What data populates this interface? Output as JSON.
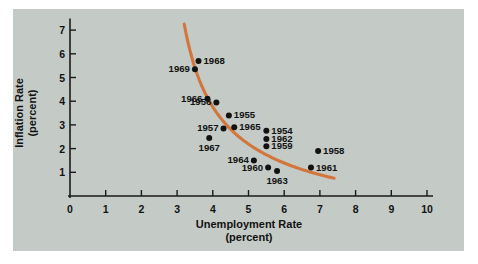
{
  "chart_data": {
    "type": "scatter",
    "title": "",
    "subtitle": "",
    "xlabel": "Unemployment Rate",
    "xlabel_unit": "(percent)",
    "ylabel": "Inflation Rate",
    "ylabel_unit": "(percent)",
    "xlim": [
      0,
      10
    ],
    "ylim": [
      0,
      7.4
    ],
    "xticks": [
      "0",
      "1",
      "2",
      "3",
      "4",
      "5",
      "6",
      "7",
      "8",
      "9",
      "10"
    ],
    "yticks": [
      "1",
      "2",
      "3",
      "4",
      "5",
      "6",
      "7"
    ],
    "grid": false,
    "legend": "none",
    "point_color": "#121212",
    "curve_color": "#d2763c",
    "panel_color": "#c4cac6",
    "axis_color": "#1b1b1b",
    "points": [
      {
        "label": "1968",
        "x": 3.6,
        "y": 5.7,
        "label_side": "right"
      },
      {
        "label": "1969",
        "x": 3.5,
        "y": 5.35,
        "label_side": "left"
      },
      {
        "label": "1966",
        "x": 3.85,
        "y": 4.1,
        "label_side": "left"
      },
      {
        "label": "1956",
        "x": 4.1,
        "y": 3.95,
        "label_side": "left"
      },
      {
        "label": "1955",
        "x": 4.45,
        "y": 3.4,
        "label_side": "right"
      },
      {
        "label": "1965",
        "x": 4.6,
        "y": 2.9,
        "label_side": "right"
      },
      {
        "label": "1957",
        "x": 4.3,
        "y": 2.85,
        "label_side": "left"
      },
      {
        "label": "1967",
        "x": 3.9,
        "y": 2.45,
        "label_side": "below"
      },
      {
        "label": "1954",
        "x": 5.5,
        "y": 2.75,
        "label_side": "right"
      },
      {
        "label": "1962",
        "x": 5.5,
        "y": 2.4,
        "label_side": "right"
      },
      {
        "label": "1959",
        "x": 5.5,
        "y": 2.1,
        "label_side": "right"
      },
      {
        "label": "1958",
        "x": 6.95,
        "y": 1.9,
        "label_side": "right"
      },
      {
        "label": "1964",
        "x": 5.15,
        "y": 1.5,
        "label_side": "left"
      },
      {
        "label": "1960",
        "x": 5.55,
        "y": 1.2,
        "label_side": "left"
      },
      {
        "label": "1961",
        "x": 6.75,
        "y": 1.2,
        "label_side": "right"
      },
      {
        "label": "1963",
        "x": 5.8,
        "y": 1.05,
        "label_side": "below"
      }
    ],
    "curve": {
      "name": "Phillips curve",
      "x_start": 3.2,
      "x_end": 7.4,
      "y_start": 7.25,
      "y_end": 0.75
    }
  }
}
